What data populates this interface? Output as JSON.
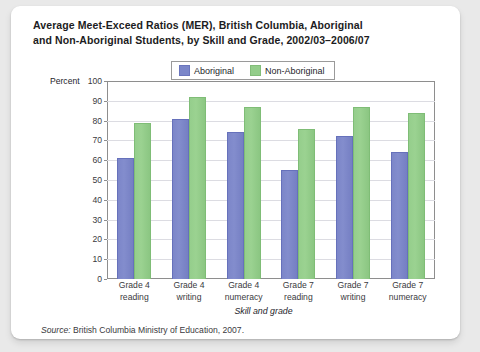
{
  "figure": {
    "title_line1": "Average Meet-Exceed Ratios (MER), British Columbia, Aboriginal",
    "title_line2": "and Non-Aboriginal Students, by Skill and Grade, 2002/03–2006/07",
    "source_prefix": "Source:",
    "source_text": "British Columbia Ministry of Education, 2007."
  },
  "chart_data": {
    "type": "bar",
    "title": "Average Meet-Exceed Ratios (MER), British Columbia, Aboriginal and Non-Aboriginal Students, by Skill and Grade, 2002/03–2006/07",
    "xlabel": "Skill and grade",
    "ylabel": "Percent",
    "ylim": [
      0,
      100
    ],
    "ytick_step": 10,
    "yticks": [
      100,
      90,
      80,
      70,
      60,
      50,
      40,
      30,
      20,
      10,
      0
    ],
    "grid": true,
    "legend_position": "top-center",
    "categories": [
      "Grade 4 reading",
      "Grade 4 writing",
      "Grade 4 numeracy",
      "Grade 7 reading",
      "Grade 7 writing",
      "Grade 7 numeracy"
    ],
    "category_lines": [
      [
        "Grade 4",
        "reading"
      ],
      [
        "Grade 4",
        "writing"
      ],
      [
        "Grade 4",
        "numeracy"
      ],
      [
        "Grade 7",
        "reading"
      ],
      [
        "Grade 7",
        "writing"
      ],
      [
        "Grade 7",
        "numeracy"
      ]
    ],
    "series": [
      {
        "name": "Aboriginal",
        "color": "#7b86c9",
        "values": [
          61,
          81,
          74,
          55,
          72,
          64
        ]
      },
      {
        "name": "Non-Aboriginal",
        "color": "#93cd8a",
        "values": [
          79,
          92,
          87,
          76,
          87,
          84
        ]
      }
    ]
  }
}
